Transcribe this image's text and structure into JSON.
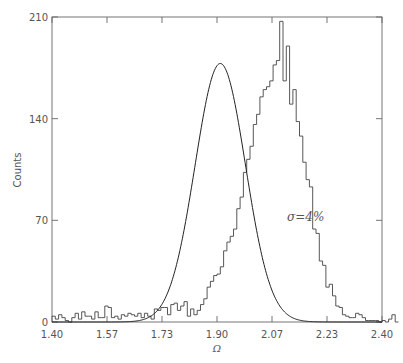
{
  "chart_data": {
    "type": "bar",
    "subtype": "histogram-with-fit",
    "title": "",
    "xlabel": "Ω",
    "ylabel": "Counts",
    "xlim": [
      1.4,
      2.4
    ],
    "ylim": [
      0,
      210
    ],
    "xticks": [
      "1.40",
      "1.57",
      "1.73",
      "1.90",
      "2.07",
      "2.23",
      "2.40"
    ],
    "xtick_values": [
      1.4,
      1.5667,
      1.7333,
      1.9,
      2.0667,
      2.2333,
      2.4
    ],
    "yticks": [
      "0",
      "70",
      "140",
      "210"
    ],
    "ytick_values": [
      0,
      70,
      140,
      210
    ],
    "grid": false,
    "annotation": "σ=4%",
    "bin_start": 1.4,
    "bin_width": 0.01,
    "series": [
      {
        "name": "histogram",
        "values": [
          4,
          2,
          5,
          3,
          1,
          0,
          3,
          6,
          2,
          7,
          4,
          4,
          2,
          7,
          3,
          3,
          11,
          10,
          3,
          4,
          2,
          5,
          4,
          6,
          5,
          4,
          6,
          3,
          6,
          4,
          2,
          9,
          8,
          10,
          10,
          5,
          12,
          13,
          8,
          11,
          14,
          4,
          9,
          5,
          8,
          12,
          16,
          24,
          28,
          32,
          33,
          38,
          49,
          55,
          59,
          64,
          78,
          86,
          103,
          112,
          121,
          136,
          143,
          155,
          160,
          162,
          166,
          177,
          180,
          207,
          166,
          190,
          150,
          160,
          138,
          128,
          110,
          98,
          93,
          64,
          61,
          42,
          39,
          24,
          26,
          18,
          11,
          10,
          5,
          4,
          3,
          3,
          6,
          5,
          3,
          1,
          1,
          1,
          1,
          0,
          1,
          0,
          2,
          5,
          0
        ]
      },
      {
        "name": "gaussian-fit",
        "mean": 1.91,
        "sigma": 0.0764,
        "amplitude": 178
      }
    ]
  }
}
